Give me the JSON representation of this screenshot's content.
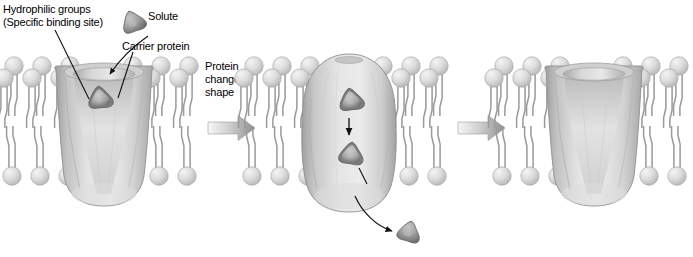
{
  "figure": {
    "title_visible": false,
    "kind": "facilitated-diffusion-carrier-protein-diagram",
    "background": "#ffffff"
  },
  "labels": {
    "hydrophilic_groups": "Hydrophilic groups\n(Specific binding site)",
    "solute": "Solute",
    "carrier_protein": "Carrier protein",
    "protein_changes_shape": "Protein\nchanges\nshape"
  },
  "colors": {
    "membrane_head_light": "#e3e3e3",
    "membrane_head_mid": "#cfcfcf",
    "membrane_head_edge": "#b4b4b4",
    "tail_stroke": "#9a9a9a",
    "protein_light": "#e6e6e6",
    "protein_mid": "#cacaca",
    "protein_dark": "#9e9e9e",
    "protein_edge": "#8c8c8c",
    "solute_fill": "#9d9d9d",
    "solute_dark": "#6f6f6f",
    "arrow_gray_start": "#f2f2f2",
    "arrow_gray_end": "#8f8f8f",
    "leader_line": "#111111",
    "text": "#000000"
  },
  "panels": [
    {
      "id": "panel-1",
      "name": "solute-bound-outside",
      "x": 0,
      "width": 205,
      "protein_shape": "funnel-open-outward",
      "solutes_inside": 1,
      "has_exiting_solute": false,
      "membrane_lipids_left": 3,
      "membrane_lipids_right": 3
    },
    {
      "id": "panel-2",
      "name": "protein-changed-shape-solute-released",
      "x": 238,
      "width": 205,
      "protein_shape": "barrel-bulged-closed",
      "solutes_inside": 2,
      "has_exiting_solute": true,
      "membrane_lipids_left": 3,
      "membrane_lipids_right": 3
    },
    {
      "id": "panel-3",
      "name": "protein-reset-empty",
      "x": 488,
      "width": 205,
      "protein_shape": "funnel-open-outward",
      "solutes_inside": 0,
      "has_exiting_solute": false,
      "membrane_lipids_left": 3,
      "membrane_lipids_right": 3
    }
  ],
  "transition_arrows": [
    {
      "id": "arrow-1-2",
      "x": 206,
      "y": 125,
      "length": 48,
      "direction": "right"
    },
    {
      "id": "arrow-2-3",
      "x": 456,
      "y": 125,
      "length": 48,
      "direction": "right"
    }
  ],
  "annotations": {
    "leader_hydrophilic_to_channel": true,
    "leader_solute_to_binding_site": true,
    "leader_carrier_to_protein_body": true,
    "internal_down_arrow_panel2": true,
    "curved_exit_arrow_panel2": true
  }
}
